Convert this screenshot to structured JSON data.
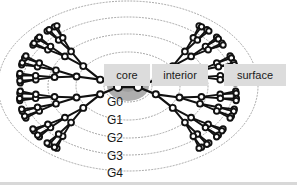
{
  "figure": {
    "background_color": "#ffffff",
    "width": 297,
    "height": 185
  },
  "region_labels": [
    {
      "name": "core",
      "text": "core",
      "x": 104,
      "y": 64,
      "width": 46,
      "background": "#dcdcdc"
    },
    {
      "name": "interior",
      "text": "interior",
      "x": 152,
      "y": 64,
      "width": 56,
      "background": "#dcdcdc"
    },
    {
      "name": "surface",
      "text": "surface",
      "x": 224,
      "y": 64,
      "width": 62,
      "background": "#dcdcdc"
    }
  ],
  "generation_labels": [
    {
      "name": "G0",
      "text": "G0",
      "x": 112,
      "y": 96
    },
    {
      "name": "G1",
      "text": "G1",
      "x": 112,
      "y": 114
    },
    {
      "name": "G2",
      "text": "G2",
      "x": 112,
      "y": 132
    },
    {
      "name": "G3",
      "text": "G3",
      "x": 112,
      "y": 150
    },
    {
      "name": "G4",
      "text": "G4",
      "x": 112,
      "y": 167
    }
  ],
  "colors": {
    "node_stroke": "#111111",
    "node_fill": "#ffffff",
    "bond_stroke": "#111111",
    "core_blob": "#aaaaaa",
    "ring_stroke": "#9a9a9a",
    "label_bg": "#dcdcdc",
    "label_text": "#1a1a1a",
    "rule": "#d8d8d8"
  },
  "chart_data": {
    "type": "diagram",
    "core": {
      "cx": 128,
      "cy": 86,
      "rx": 22,
      "ry": 16
    },
    "generation_rings": [
      {
        "label": "G0",
        "rx": 24,
        "ry": 16
      },
      {
        "label": "G1",
        "rx": 52,
        "ry": 34
      },
      {
        "label": "G2",
        "rx": 80,
        "ry": 52
      },
      {
        "label": "G3",
        "rx": 106,
        "ry": 69
      },
      {
        "label": "G4",
        "rx": 130,
        "ry": 85
      }
    ],
    "branching_factor": 2,
    "arms": 2,
    "generations": 5
  }
}
